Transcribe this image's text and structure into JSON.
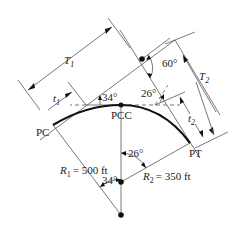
{
  "diagram": {
    "points": {
      "pc": "PC",
      "pcc": "PCC",
      "pt": "PT"
    },
    "radii": {
      "r1_symbol": "R",
      "r1_sub": "1",
      "r1_value": "= 500 ft",
      "r2_symbol": "R",
      "r2_sub": "2",
      "r2_value": "= 350 ft"
    },
    "tangents": {
      "T1_symbol": "T",
      "T1_sub": "1",
      "T2_symbol": "T",
      "T2_sub": "2",
      "t1_symbol": "t",
      "t1_sub": "1",
      "t2_symbol": "t",
      "t2_sub": "2"
    },
    "angles": {
      "total": "60°",
      "delta1_top": "34°",
      "delta2_top": "26°",
      "delta1_center": "34°",
      "delta2_center": "26°"
    },
    "colors": {
      "curve": "#111111",
      "lines": "#555555",
      "text": "#222222"
    }
  }
}
